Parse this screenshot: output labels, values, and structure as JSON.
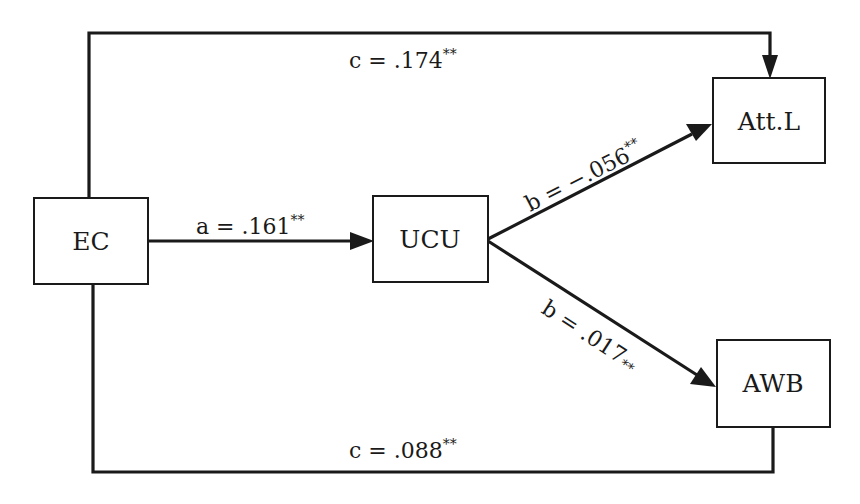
{
  "diagram": {
    "type": "mediation-path-diagram",
    "nodes": {
      "ec": {
        "label": "EC"
      },
      "ucu": {
        "label": "UCU"
      },
      "att_l": {
        "label": "Att.L"
      },
      "awb": {
        "label": "AWB"
      }
    },
    "edges": {
      "a": {
        "from": "EC",
        "to": "UCU",
        "name": "a",
        "value": ".161",
        "sig": "**",
        "text": "a = .161"
      },
      "b_att": {
        "from": "UCU",
        "to": "Att.L",
        "name": "b",
        "value": "−.056",
        "sig": "**",
        "text": "b = −.056"
      },
      "b_awb": {
        "from": "UCU",
        "to": "AWB",
        "name": "b",
        "value": ".017",
        "sig": "**",
        "text": "b = .017"
      },
      "c_att": {
        "from": "EC",
        "to": "Att.L",
        "name": "c",
        "value": ".174",
        "sig": "**",
        "text": "c = .174"
      },
      "c_awb": {
        "from": "EC",
        "to": "AWB",
        "name": "c",
        "value": ".088",
        "sig": "**",
        "text": "c = .088"
      }
    },
    "colors": {
      "stroke": "#1a1a1a",
      "background": "#ffffff"
    }
  }
}
